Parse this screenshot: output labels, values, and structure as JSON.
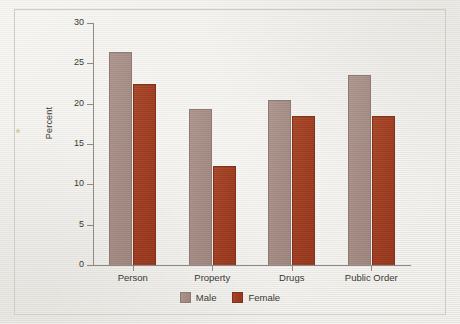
{
  "figure": {
    "axis_color": "#8e8b86",
    "text_color": "#3a3833",
    "paper_color": "#eceae5"
  },
  "chart_data": {
    "type": "bar",
    "title": "",
    "subtitle": "",
    "xlabel": "",
    "ylabel": "Percent",
    "categories": [
      "Person",
      "Property",
      "Drugs",
      "Public Order"
    ],
    "series": [
      {
        "name": "Male",
        "color": "#a28981",
        "values": [
          26.4,
          19.3,
          20.5,
          23.6
        ]
      },
      {
        "name": "Female",
        "color": "#9d3a1e",
        "values": [
          22.4,
          12.3,
          18.5,
          18.5
        ]
      }
    ],
    "ylim": [
      0,
      30
    ],
    "ytick_values": [
      0,
      5,
      10,
      15,
      20,
      25,
      30
    ],
    "ytick_labels": [
      "0",
      "5",
      "10",
      "15",
      "20",
      "25",
      "30"
    ],
    "grid": false,
    "legend_position": "bottom-center",
    "legend_entries": [
      "Male",
      "Female"
    ]
  }
}
